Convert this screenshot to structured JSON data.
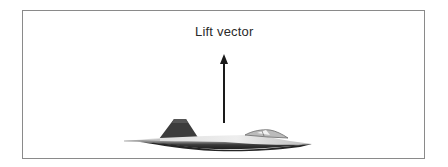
{
  "diagram": {
    "label": "Lift vector",
    "arrow": {
      "direction": "up",
      "x": 224,
      "y_tail": 123,
      "y_head": 54
    }
  }
}
